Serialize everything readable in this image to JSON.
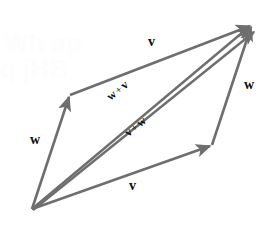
{
  "figure": {
    "width": 277,
    "height": 229,
    "background_color": "#ffffff",
    "stroke_color": "#6e6e6e",
    "label_color": "#111111"
  },
  "labels": {
    "top_edge": "v",
    "bottom_edge": "v",
    "left_edge": "w",
    "right_edge": "w",
    "diagonal_upper_first": "w",
    "diagonal_upper_plus": "+",
    "diagonal_upper_second": "v",
    "diagonal_lower_first": "v",
    "diagonal_lower_plus": "+",
    "diagonal_lower_second": "w"
  },
  "watermark": {
    "line1": "Wh ap",
    "line2": "q jHB"
  },
  "geometry": {
    "origin": "32,209",
    "upper_left_vertex": "70,95",
    "lower_right_vertex": "212,145",
    "top_right_vertex": "252,24"
  }
}
